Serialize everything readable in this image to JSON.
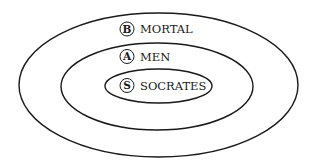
{
  "diagram": {
    "type": "euler-nested-sets",
    "stroke_color": "#1a1a1a",
    "background": "#ffffff",
    "sets": [
      {
        "id": "B",
        "label": "MORTAL",
        "level": "outer"
      },
      {
        "id": "A",
        "label": "MEN",
        "level": "middle"
      },
      {
        "id": "S",
        "label": "SOCRATES",
        "level": "inner"
      }
    ]
  }
}
